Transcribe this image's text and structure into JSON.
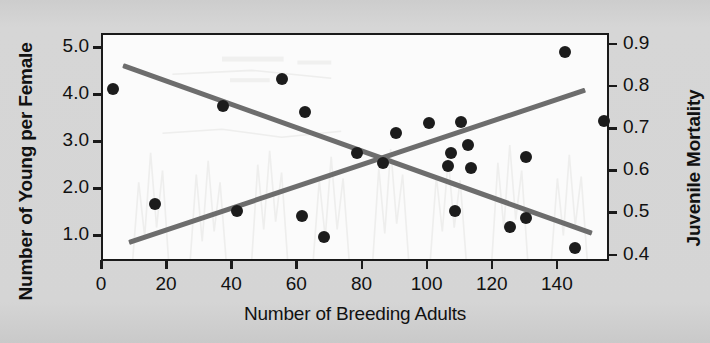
{
  "chart_data": {
    "type": "scatter",
    "title": "",
    "xlabel": "Number of Breeding Adults",
    "ylabel": "Number of Young per Female",
    "y2label": "Juvenile Mortality",
    "xlim": [
      0,
      156
    ],
    "ylim": [
      0.45,
      5.3
    ],
    "y2lim": [
      0.385,
      0.925
    ],
    "grid": false,
    "legend": "none",
    "xticks": [
      "0",
      "20",
      "40",
      "60",
      "80",
      "100",
      "120",
      "140"
    ],
    "xtick_values": [
      0,
      20,
      40,
      60,
      80,
      100,
      120,
      140
    ],
    "yticks": [
      "1.0",
      "2.0",
      "3.0",
      "4.0",
      "5.0"
    ],
    "ytick_values": [
      1.0,
      2.0,
      3.0,
      4.0,
      5.0
    ],
    "y2ticks": [
      "0.4",
      "0.5",
      "0.6",
      "0.7",
      "0.8",
      "0.9"
    ],
    "y2tick_values": [
      0.4,
      0.5,
      0.6,
      0.7,
      0.8,
      0.9
    ],
    "series": [
      {
        "name": "Number of Young per Female",
        "axis": "left",
        "marker": "filled-circle",
        "color": "#1c1c1c",
        "points": [
          {
            "x": 3,
            "y": 4.15
          },
          {
            "x": 16,
            "y": 1.7
          },
          {
            "x": 37,
            "y": 3.8
          },
          {
            "x": 41,
            "y": 1.55
          },
          {
            "x": 55,
            "y": 4.37
          },
          {
            "x": 61,
            "y": 1.45
          },
          {
            "x": 62,
            "y": 3.66
          },
          {
            "x": 68,
            "y": 1.0
          },
          {
            "x": 78,
            "y": 2.78
          },
          {
            "x": 86,
            "y": 2.58
          },
          {
            "x": 90,
            "y": 3.22
          },
          {
            "x": 100,
            "y": 3.43
          },
          {
            "x": 106,
            "y": 2.52
          },
          {
            "x": 107,
            "y": 2.8
          },
          {
            "x": 108,
            "y": 1.56
          },
          {
            "x": 110,
            "y": 3.44
          },
          {
            "x": 112,
            "y": 2.95
          },
          {
            "x": 113,
            "y": 2.48
          },
          {
            "x": 125,
            "y": 1.22
          },
          {
            "x": 130,
            "y": 2.7
          },
          {
            "x": 130,
            "y": 1.4
          },
          {
            "x": 142,
            "y": 4.94
          },
          {
            "x": 145,
            "y": 0.76
          },
          {
            "x": 154,
            "y": 3.46
          }
        ]
      }
    ],
    "trend_lines": [
      {
        "name": "young-per-female-trend",
        "axis": "left",
        "direction": "decreasing",
        "color": "#6d6d6d",
        "x_start": 6,
        "y_start": 4.65,
        "x_end": 150,
        "y_end": 1.08
      },
      {
        "name": "juvenile-mortality-trend",
        "axis": "left-scaled",
        "direction": "increasing",
        "color": "#6d6d6d",
        "x_start": 8,
        "y_start": 0.88,
        "x_end": 148,
        "y_end": 4.12
      }
    ]
  }
}
